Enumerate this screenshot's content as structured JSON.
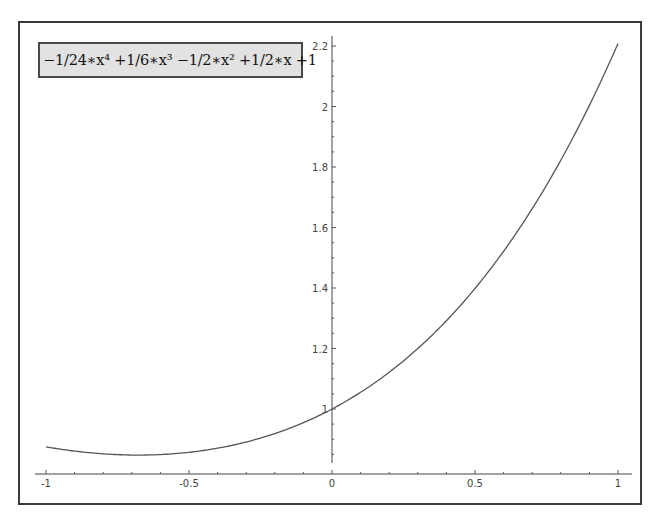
{
  "chart_data": {
    "type": "line",
    "title": "",
    "xlabel": "",
    "ylabel": "",
    "legend": [
      "−1/24∗x⁴ +1/6∗x³ −1/2∗x² +1/2∗x +1"
    ],
    "legend_position": "top-left",
    "grid": false,
    "xlim": [
      -1.04,
      1.05
    ],
    "ylim": [
      0.82,
      2.23
    ],
    "x_ticks": [
      -1,
      -0.5,
      0,
      0.5,
      1
    ],
    "x_tick_labels": [
      "-1",
      "-0.5",
      "0",
      "0.5",
      "1"
    ],
    "y_ticks": [
      1,
      1.2,
      1.4,
      1.6,
      1.8,
      2,
      2.2
    ],
    "y_tick_labels": [
      "1",
      "1.2",
      "1.4",
      "1.6",
      "1.8",
      "2",
      "2.2"
    ],
    "series": [
      {
        "name": "−1/24∗x⁴ +1/6∗x³ −1/2∗x² +1/2∗x +1",
        "color": "#555555",
        "x": [
          -1,
          -0.9,
          -0.8,
          -0.7,
          -0.6,
          -0.5,
          -0.4,
          -0.3,
          -0.2,
          -0.1,
          0,
          0.1,
          0.2,
          0.3,
          0.4,
          0.5,
          0.6,
          0.7,
          0.8,
          0.9,
          1
        ],
        "y": [
          0.875,
          0.857,
          0.848,
          0.845,
          0.849,
          0.859,
          0.875,
          0.897,
          0.919,
          0.955,
          1.0,
          1.055,
          1.121,
          1.198,
          1.287,
          1.388,
          1.502,
          1.63,
          1.772,
          1.93,
          2.208
        ]
      }
    ]
  },
  "legend": {
    "label": "−1/24∗x⁴ +1/6∗x³ −1/2∗x² +1/2∗x +1"
  }
}
